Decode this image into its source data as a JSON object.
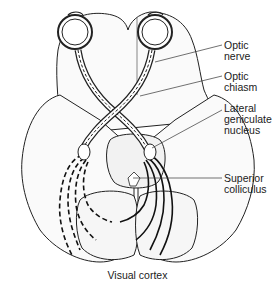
{
  "diagram": {
    "labels": [
      {
        "id": "optic-nerve",
        "line1": "Optic",
        "line2": "nerve",
        "line3": ""
      },
      {
        "id": "optic-chiasm",
        "line1": "Optic",
        "line2": "chiasm",
        "line3": ""
      },
      {
        "id": "lateral-geniculate-nucleus",
        "line1": "Lateral",
        "line2": "geniculate",
        "line3": "nucleus"
      },
      {
        "id": "superior-colliculus",
        "line1": "Superior",
        "line2": "colliculus",
        "line3": ""
      }
    ],
    "caption": "Visual cortex"
  }
}
